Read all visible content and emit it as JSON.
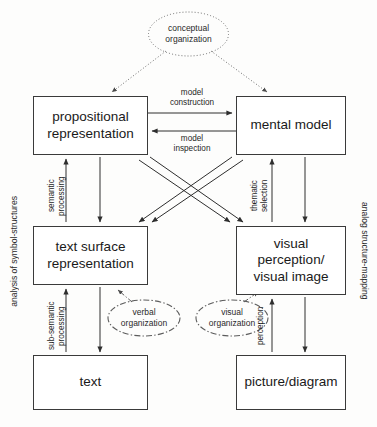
{
  "diagram": {
    "side_labels": {
      "left": "analysis of symbol-structures",
      "right": "analog structure-mapping"
    },
    "nodes": [
      {
        "id": "propositional-representation",
        "label": "propositional\nrepresentation"
      },
      {
        "id": "mental-model",
        "label": "mental model"
      },
      {
        "id": "text-surface-representation",
        "label": "text surface\nrepresentation"
      },
      {
        "id": "visual-perception-visual-image",
        "label": "visual\nperception/\nvisual image"
      },
      {
        "id": "text",
        "label": "text"
      },
      {
        "id": "picture-diagram",
        "label": "picture/diagram"
      }
    ],
    "ellipses": [
      {
        "id": "conceptual-organization",
        "label": "conceptual\norganization",
        "style": "dotted"
      },
      {
        "id": "verbal-organization",
        "label": "verbal\norganization",
        "style": "dash-dot"
      },
      {
        "id": "visual-organization",
        "label": "visual\norganization",
        "style": "dash-dot"
      }
    ],
    "edge_labels": [
      {
        "id": "model-construction",
        "label": "model\nconstruction",
        "orientation": "horizontal"
      },
      {
        "id": "model-inspection",
        "label": "model\ninspection",
        "orientation": "horizontal"
      },
      {
        "id": "semantic-processing",
        "label": "semantic\nprocessing",
        "orientation": "vertical"
      },
      {
        "id": "thematic-selection",
        "label": "thematic\nselection",
        "orientation": "vertical"
      },
      {
        "id": "sub-semantic-processing",
        "label": "sub-semantic\nprocessing",
        "orientation": "vertical"
      },
      {
        "id": "perception",
        "label": "perception",
        "orientation": "vertical"
      }
    ],
    "colors": {
      "stroke": "#3a3a3a",
      "text": "#1a1a1a",
      "background": "#ffffff"
    }
  }
}
